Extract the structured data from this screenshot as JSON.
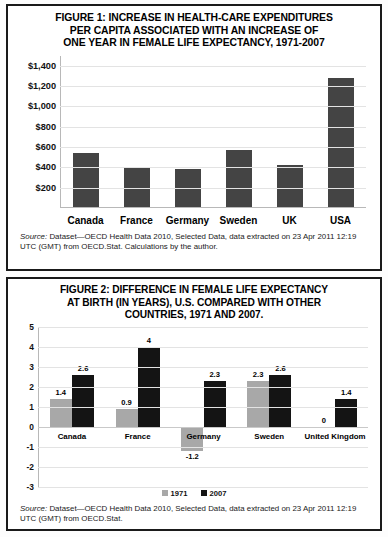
{
  "figure1": {
    "title": "FIGURE 1: INCREASE IN HEALTH-CARE EXPENDITURES PER CAPITA ASSOCIATED WITH AN INCREASE OF ONE YEAR IN FEMALE LIFE EXPECTANCY, 1971-2007",
    "title_line1": "FIGURE 1: INCREASE IN HEALTH-CARE EXPENDITURES",
    "title_line2": "PER CAPITA ASSOCIATED WITH AN INCREASE OF",
    "title_line3": "ONE YEAR IN FEMALE LIFE EXPECTANCY, 1971-2007",
    "source_label": "Source:",
    "source_text": " Dataset—OECD Health Data 2010, Selected Data, data extracted on 23 Apr 2011 12:19 UTC (GMT) from OECD.Stat. Calculations by the author."
  },
  "figure2": {
    "title": "FIGURE 2: DIFFERENCE IN FEMALE LIFE EXPECTANCY AT BIRTH (IN YEARS), U.S. COMPARED WITH OTHER COUNTRIES, 1971 AND 2007.",
    "title_line1": "FIGURE 2: DIFFERENCE IN FEMALE LIFE EXPECTANCY",
    "title_line2": "AT BIRTH (IN YEARS), U.S. COMPARED WITH OTHER",
    "title_line3": "COUNTRIES, 1971 AND 2007.",
    "source_label": "Source:",
    "source_text": " Dataset—OECD Health Data 2010, Selected Data, data extracted on 23 Apr 2011 12:19 UTC (GMT) from OECD.Stat."
  },
  "chart_data": [
    {
      "type": "bar",
      "id": "figure-1",
      "title": "FIGURE 1: INCREASE IN HEALTH-CARE EXPENDITURES PER CAPITA ASSOCIATED WITH AN INCREASE OF ONE YEAR IN FEMALE LIFE EXPECTANCY, 1971-2007",
      "xlabel": "",
      "ylabel": "",
      "categories": [
        "Canada",
        "France",
        "Germany",
        "Sweden",
        "UK",
        "USA"
      ],
      "values": [
        540,
        400,
        385,
        570,
        420,
        1285
      ],
      "ylim": [
        0,
        1500
      ],
      "yticks": [
        1400,
        1200,
        1000,
        800,
        600,
        400,
        200
      ],
      "ytick_labels": [
        "$1,400",
        "$1,200",
        "$1,000",
        "$800",
        "$600",
        "$400",
        "$200"
      ],
      "grid": true,
      "legend": false,
      "bar_color": "#444444"
    },
    {
      "type": "bar",
      "id": "figure-2",
      "title": "FIGURE 2: DIFFERENCE IN FEMALE LIFE EXPECTANCY AT BIRTH (IN YEARS), U.S. COMPARED WITH OTHER COUNTRIES, 1971 AND 2007.",
      "xlabel": "",
      "ylabel": "",
      "categories": [
        "Canada",
        "France",
        "Germany",
        "Sweden",
        "United Kingdom"
      ],
      "series": [
        {
          "name": "1971",
          "color": "#a8a8a8",
          "values": [
            1.4,
            0.9,
            -1.2,
            2.3,
            0
          ]
        },
        {
          "name": "2007",
          "color": "#141414",
          "values": [
            2.6,
            4,
            2.3,
            2.6,
            1.4
          ]
        }
      ],
      "value_labels": {
        "1971": [
          "1.4",
          "0.9",
          "-1.2",
          "2.3",
          "0"
        ],
        "2007": [
          "2.6",
          "4",
          "2.3",
          "2.6",
          "1.4"
        ]
      },
      "ylim": [
        -3,
        5
      ],
      "yticks": [
        5,
        4,
        3,
        2,
        1,
        0,
        -1,
        -2,
        -3
      ],
      "ytick_labels": [
        "5",
        "4",
        "3",
        "2",
        "1",
        "0",
        "-1",
        "-2",
        "-3"
      ],
      "grid": true,
      "legend": true,
      "legend_position": "bottom",
      "legend_entries": [
        "1971",
        "2007"
      ]
    }
  ]
}
